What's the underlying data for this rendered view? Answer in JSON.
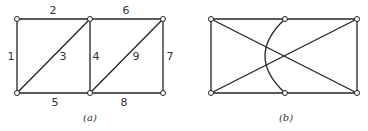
{
  "figure_a": {
    "caption": "(a)",
    "edge_labels": {
      "e1": "1",
      "e2": "2",
      "e3": "3",
      "e4": "4",
      "e5": "5",
      "e6": "6",
      "e7": "7",
      "e8": "8",
      "e9": "9"
    },
    "nodes": [
      [
        17,
        19
      ],
      [
        90,
        19
      ],
      [
        163,
        19
      ],
      [
        17,
        93
      ],
      [
        90,
        93
      ],
      [
        163,
        93
      ]
    ]
  },
  "figure_b": {
    "caption": "(b)",
    "nodes": [
      [
        211,
        19
      ],
      [
        285,
        19
      ],
      [
        357,
        19
      ],
      [
        211,
        93
      ],
      [
        285,
        93
      ],
      [
        357,
        93
      ]
    ]
  },
  "colors": {
    "stroke": "#222222",
    "background": "#ffffff"
  }
}
